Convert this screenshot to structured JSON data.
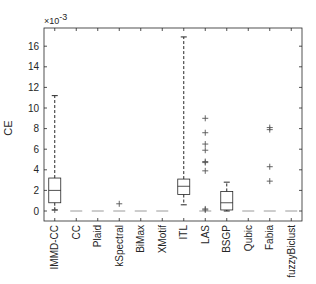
{
  "chart_data": {
    "type": "box",
    "title": "",
    "xlabel": "",
    "ylabel": "CE",
    "y_scale_note": "×10^-3",
    "ylim": [
      -0.8,
      17.8
    ],
    "yticks": [
      0,
      2,
      4,
      6,
      8,
      10,
      12,
      14,
      16
    ],
    "grid": false,
    "legend": null,
    "categories": [
      "IMMD-CC",
      "CC",
      "Plaid",
      "kSpectral",
      "BiMax",
      "XMotif",
      "ITL",
      "LAS",
      "BSGP",
      "Qubic",
      "Fabia",
      "fuzzyBiclust"
    ],
    "boxes": [
      {
        "name": "IMMD-CC",
        "whisker_low": 0.1,
        "q1": 0.8,
        "median": 2.0,
        "q3": 3.2,
        "whisker_high": 11.2,
        "outliers": [
          0.1
        ]
      },
      {
        "name": "CC",
        "whisker_low": 0,
        "q1": 0,
        "median": 0,
        "q3": 0,
        "whisker_high": 0,
        "outliers": []
      },
      {
        "name": "Plaid",
        "whisker_low": 0,
        "q1": 0,
        "median": 0,
        "q3": 0,
        "whisker_high": 0,
        "outliers": []
      },
      {
        "name": "kSpectral",
        "whisker_low": 0,
        "q1": 0,
        "median": 0,
        "q3": 0,
        "whisker_high": 0,
        "outliers": [
          0.7
        ]
      },
      {
        "name": "BiMax",
        "whisker_low": 0,
        "q1": 0,
        "median": 0,
        "q3": 0,
        "whisker_high": 0,
        "outliers": []
      },
      {
        "name": "XMotif",
        "whisker_low": 0,
        "q1": 0,
        "median": 0,
        "q3": 0,
        "whisker_high": 0,
        "outliers": []
      },
      {
        "name": "ITL",
        "whisker_low": 0.6,
        "q1": 1.6,
        "median": 2.4,
        "q3": 3.1,
        "whisker_high": 16.9,
        "outliers": []
      },
      {
        "name": "LAS",
        "whisker_low": 0,
        "q1": 0,
        "median": 0,
        "q3": 0,
        "whisker_high": 0,
        "outliers": [
          0.1,
          0.2,
          3.9,
          4.7,
          4.8,
          5.9,
          6.5,
          7.6,
          9.0
        ]
      },
      {
        "name": "BSGP",
        "whisker_low": 0,
        "q1": 0.1,
        "median": 0.8,
        "q3": 1.9,
        "whisker_high": 2.8,
        "outliers": []
      },
      {
        "name": "Qubic",
        "whisker_low": 0,
        "q1": 0,
        "median": 0,
        "q3": 0,
        "whisker_high": 0,
        "outliers": []
      },
      {
        "name": "Fabia",
        "whisker_low": 0,
        "q1": 0,
        "median": 0,
        "q3": 0,
        "whisker_high": 0,
        "outliers": [
          2.9,
          4.3,
          7.9,
          8.1
        ]
      },
      {
        "name": "fuzzyBiclust",
        "whisker_low": 0,
        "q1": 0,
        "median": 0,
        "q3": 0,
        "whisker_high": 0,
        "outliers": []
      }
    ]
  },
  "axis": {
    "ylabel": "CE",
    "multiplier_base": "×10",
    "multiplier_exp": "-3"
  }
}
